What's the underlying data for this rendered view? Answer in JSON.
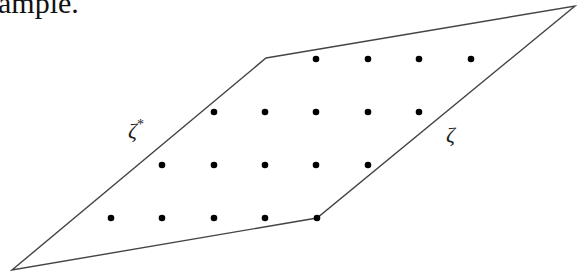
{
  "caption": "ample.",
  "diagram": {
    "polygon": [
      [
        266,
        58
      ],
      [
        575,
        6
      ],
      [
        317,
        218
      ],
      [
        12,
        270
      ]
    ],
    "edge_color": "#444444",
    "dot_color": "#000000",
    "dot_radius": 3.3,
    "dots": [
      [
        316,
        59
      ],
      [
        368,
        59
      ],
      [
        419,
        59
      ],
      [
        471,
        59
      ],
      [
        214,
        112
      ],
      [
        265,
        112
      ],
      [
        316,
        112
      ],
      [
        368,
        112
      ],
      [
        419,
        112
      ],
      [
        162,
        165
      ],
      [
        214,
        165
      ],
      [
        265,
        165
      ],
      [
        316,
        165
      ],
      [
        368,
        165
      ],
      [
        111,
        218
      ],
      [
        162,
        218
      ],
      [
        214,
        218
      ],
      [
        265,
        218
      ],
      [
        317,
        218
      ]
    ],
    "labels": {
      "left_edge": "ζ*",
      "right_edge": "ζ"
    }
  }
}
